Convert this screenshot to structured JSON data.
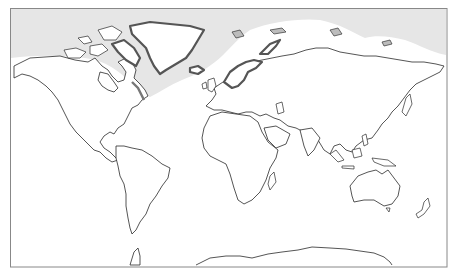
{
  "map": {
    "projection": "equirectangular-world",
    "frame": {
      "x": 10,
      "y": 8,
      "width": 437,
      "height": 259,
      "stroke": "#888888"
    },
    "colors": {
      "background": "#ffffff",
      "ocean": "#ffffff",
      "land": "#ffffff",
      "coastline": "#2a2a2a",
      "shaded_region": "#e6e6e6",
      "shaded_coast_highlight": "#8a8a8a"
    },
    "layers": [
      {
        "name": "shaded-northern-region",
        "description": "light gray band covering high northern latitudes (Arctic / North Atlantic)"
      },
      {
        "name": "continents",
        "items": [
          "North America",
          "Greenland",
          "South America",
          "Europe",
          "Africa",
          "Asia",
          "Australia",
          "Antarctica",
          "New Zealand",
          "Madagascar",
          "Japan",
          "Indonesia",
          "British Isles",
          "Iceland",
          "Svalbard",
          "Novaya Zemlya"
        ]
      },
      {
        "name": "highlighted-coasts",
        "description": "thick dark-gray coastlines on Greenland, Labrador/Baffin, Scandinavia, Novaya Zemlya, Iceland"
      }
    ]
  }
}
